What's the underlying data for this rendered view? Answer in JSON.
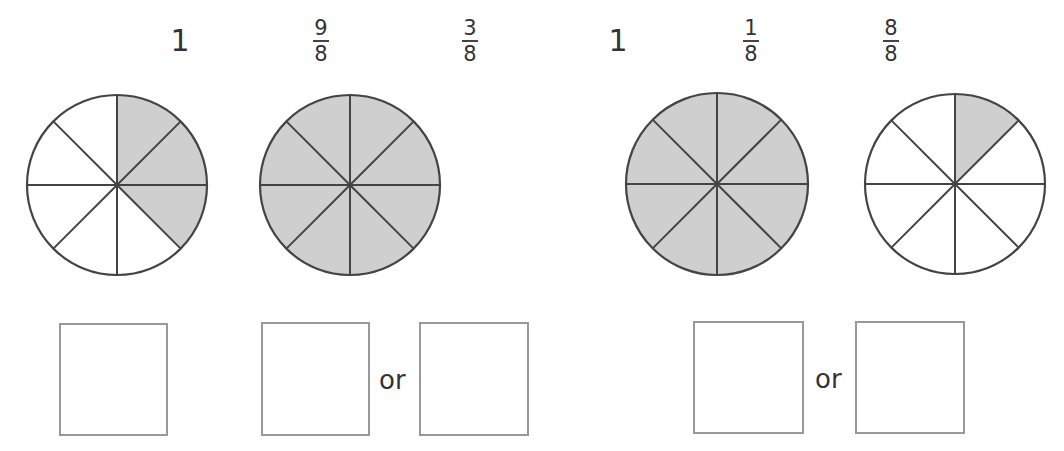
{
  "labels": [
    {
      "type": "whole",
      "value": "1"
    },
    {
      "type": "fraction",
      "numerator": "9",
      "denominator": "8"
    },
    {
      "type": "fraction",
      "numerator": "3",
      "denominator": "8"
    },
    {
      "type": "whole",
      "value": "1"
    },
    {
      "type": "fraction",
      "numerator": "1",
      "denominator": "8"
    },
    {
      "type": "fraction",
      "numerator": "8",
      "denominator": "8"
    }
  ],
  "circles": [
    {
      "parts": 8,
      "shaded": 3,
      "shade_color": "#cfcfcf"
    },
    {
      "parts": 8,
      "shaded": 8,
      "shade_color": "#cfcfcf"
    },
    {
      "parts": 8,
      "shaded": 8,
      "shade_color": "#cfcfcf"
    },
    {
      "parts": 8,
      "shaded": 1,
      "shade_color": "#cfcfcf"
    }
  ],
  "answer_boxes": {
    "or_text_1": "or",
    "or_text_2": "or"
  },
  "colors": {
    "stroke": "#444444",
    "shade": "#cfcfcf",
    "box_border": "#999999"
  }
}
